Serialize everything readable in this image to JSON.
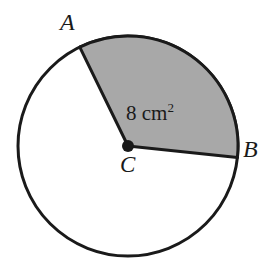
{
  "figure": {
    "background_color": "#ffffff",
    "stroke_color": "#1a1a1a",
    "sector_fill_color": "#a8a8a8",
    "circle_fill_color": "#ffffff"
  },
  "labels": {
    "point_a": "A",
    "point_b": "B",
    "center_c": "C",
    "area_value": "8",
    "area_unit": "cm",
    "area_unit_exponent": "2"
  },
  "geometry": {
    "center_x": 128,
    "center_y": 146,
    "radius": 110,
    "stroke_width": 3,
    "center_dot_radius": 6,
    "sector_start_angle_deg": 116,
    "sector_end_angle_deg": -6,
    "point_a_x": 80,
    "point_a_y": 47,
    "point_b_x": 237,
    "point_b_y": 158
  }
}
